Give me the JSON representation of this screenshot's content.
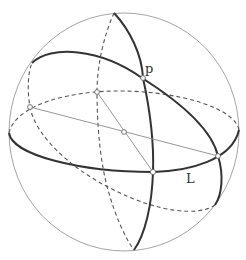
{
  "figure": {
    "labels": {
      "p": "p",
      "L": "L"
    },
    "colors": {
      "outline": "#9a9a9a",
      "thick_curve": "#333333",
      "dashed_curve": "#555555",
      "background": "#ffffff"
    }
  }
}
